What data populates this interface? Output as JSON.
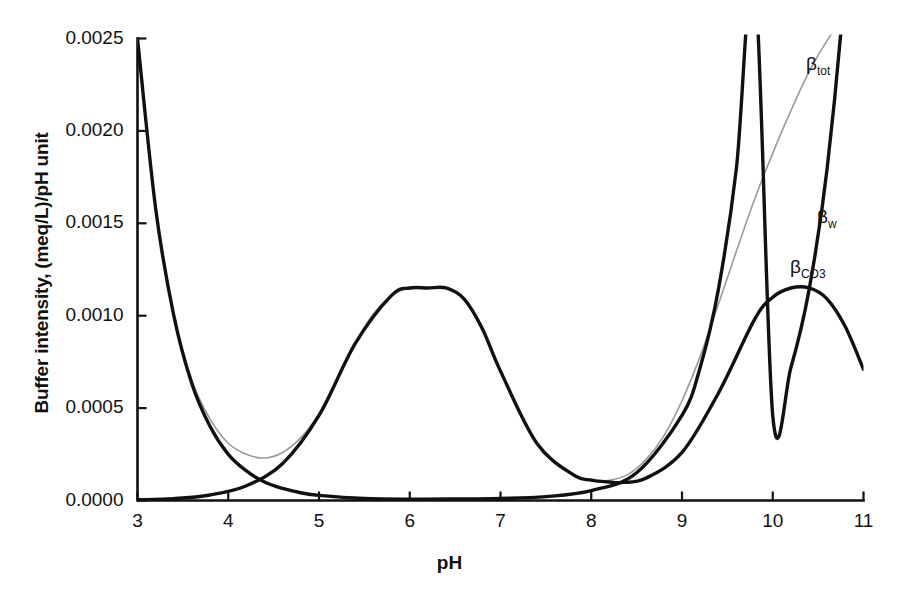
{
  "chart_data": {
    "type": "line",
    "title": "",
    "xlabel": "pH",
    "ylabel": "Buffer intensity, (meq/L)/pH unit",
    "xlim": [
      3,
      11
    ],
    "ylim": [
      0.0,
      0.0025
    ],
    "grid": false,
    "legend_position": "inline-right",
    "xticks": [
      3,
      4,
      5,
      6,
      7,
      8,
      9,
      10,
      11
    ],
    "xtick_labels": [
      "3",
      "4",
      "5",
      "6",
      "7",
      "8",
      "9",
      "10",
      "11"
    ],
    "yticks": [
      0.0,
      0.0005,
      0.001,
      0.0015,
      0.002,
      0.0025
    ],
    "ytick_labels": [
      "0.0000",
      "0.0005",
      "0.0010",
      "0.0015",
      "0.0020",
      "0.0025"
    ],
    "series": [
      {
        "name": "beta_tot",
        "label_html": "β<sub>tot</sub>",
        "label_plain": "βtot",
        "color": "#9a9a9a",
        "width": 1.6,
        "x": [
          3.0,
          3.2,
          3.4,
          3.6,
          3.8,
          4.0,
          4.2,
          4.4,
          4.6,
          4.8,
          5.0,
          5.2,
          5.4,
          5.6,
          5.8,
          6.0,
          6.2,
          6.4,
          6.6,
          6.8,
          7.0,
          7.2,
          7.4,
          7.6,
          7.8,
          8.0,
          8.2,
          8.4,
          8.6,
          8.8,
          9.0,
          9.2,
          9.4,
          9.6,
          9.8,
          10.0,
          10.2,
          10.4,
          10.6,
          10.8,
          10.9
        ],
        "y": [
          0.0025,
          0.00159,
          0.00101,
          0.00065,
          0.00044,
          0.00031,
          0.00025,
          0.00023,
          0.00026,
          0.00034,
          0.00047,
          0.00065,
          0.00085,
          0.00101,
          0.00111,
          0.00115,
          0.00115,
          0.00115,
          0.00109,
          0.00093,
          0.0007,
          0.00048,
          0.00031,
          0.0002,
          0.00014,
          0.00011,
          0.00011,
          0.00014,
          0.00022,
          0.00035,
          0.00054,
          0.00078,
          0.00106,
          0.00135,
          0.00163,
          0.00188,
          0.00211,
          0.00232,
          0.00249,
          0.00262,
          0.00266
        ]
      },
      {
        "name": "beta_w",
        "label_html": "β<sub>w</sub>",
        "label_plain": "βw",
        "color": "#111111",
        "width": 3.4,
        "x": [
          3.0,
          3.2,
          3.4,
          3.6,
          3.8,
          4.0,
          4.2,
          4.4,
          4.6,
          4.8,
          5.0,
          5.5,
          6.0,
          6.5,
          7.0,
          7.5,
          8.0,
          8.5,
          9.0,
          9.2,
          9.4,
          9.6,
          9.8,
          10.0,
          10.2,
          10.4,
          10.6,
          10.8,
          11.0
        ],
        "y": [
          0.0025,
          0.00158,
          0.001,
          0.00063,
          0.0004,
          0.00025,
          0.00016,
          0.0001,
          6.5e-05,
          4.2e-05,
          2.8e-05,
          1.1e-05,
          7e-06,
          8e-06,
          1.1e-05,
          2.1e-05,
          5.4e-05,
          0.00015,
          0.00046,
          0.00072,
          0.00114,
          0.0018,
          0.00284,
          0.00046,
          0.00072,
          0.00114,
          0.0018,
          0.00284,
          0.00449
        ]
      },
      {
        "name": "beta_CO3",
        "label_html": "β<sub>CO3</sub>",
        "label_plain": "βCO3",
        "color": "#111111",
        "width": 3.4,
        "x": [
          3.0,
          3.4,
          3.8,
          4.2,
          4.6,
          5.0,
          5.4,
          5.8,
          6.0,
          6.2,
          6.4,
          6.6,
          6.8,
          7.0,
          7.4,
          7.8,
          8.0,
          8.2,
          8.35,
          8.6,
          9.0,
          9.4,
          9.8,
          10.0,
          10.2,
          10.4,
          10.6,
          10.8,
          11.0
        ],
        "y": [
          4e-06,
          1e-05,
          3e-05,
          8e-05,
          0.0002,
          0.00046,
          0.00085,
          0.00111,
          0.00115,
          0.00115,
          0.00115,
          0.00109,
          0.00093,
          0.0007,
          0.00031,
          0.00014,
          0.00011,
          0.0001,
          9.8e-05,
          0.00012,
          0.00026,
          0.00058,
          0.00098,
          0.0011,
          0.00115,
          0.00115,
          0.00109,
          0.00094,
          0.00071
        ]
      }
    ],
    "annotations": [
      {
        "name": "beta-tot-label",
        "text_html": "β<sub>tot</sub>",
        "x_px": 806,
        "y_px": 53
      },
      {
        "name": "beta-w-label",
        "text_html": "β<sub>w</sub>",
        "x_px": 817,
        "y_px": 206
      },
      {
        "name": "beta-co3-label",
        "text_html": "β<sub>CO3</sub>",
        "x_px": 790,
        "y_px": 256
      }
    ]
  },
  "axes": {
    "x_label": "pH",
    "y_label": "Buffer intensity, (meq/L)/pH unit"
  },
  "colors": {
    "background": "#ffffff",
    "axis": "#111111",
    "beta_tot": "#9a9a9a",
    "beta_w": "#111111",
    "beta_co3": "#111111"
  }
}
